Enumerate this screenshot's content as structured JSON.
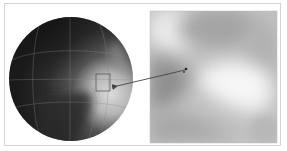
{
  "figure": {
    "colors": {
      "background": "#ffffff",
      "frame_border": "#d4d4d4",
      "sphere_dark": "#1e1e1e",
      "sphere_light": "#c8c8c8",
      "grid_line": "#8a8a8a",
      "inset_light": "#f4f4f4",
      "inset_mid": "#c4c4c4",
      "inset_dark": "#8c8c8c",
      "arrow": "#444444"
    },
    "sphere": {
      "cx": 71,
      "cy": 79,
      "r": 62
    },
    "highlight_box": {
      "x": 96,
      "y": 74,
      "width": 14,
      "height": 17
    },
    "arrow": {
      "x1": 117,
      "y1": 86,
      "x2": 186,
      "y2": 70
    },
    "inset": {
      "x": 150,
      "y": 11,
      "width": 127,
      "height": 132
    }
  }
}
